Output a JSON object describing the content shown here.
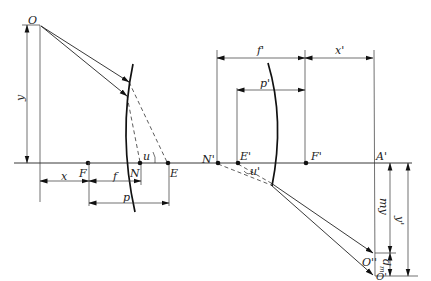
{
  "diagram": {
    "title": "",
    "points": {
      "O": "O",
      "F": "F",
      "N": "N",
      "E": "E",
      "N_prime": "N'",
      "E_prime": "E'",
      "F_prime": "F'",
      "A_prime": "A'",
      "O_double_prime": "O''",
      "O_prime": "O'"
    },
    "dimensions": {
      "y": "y",
      "x": "x",
      "f": "f",
      "p": "p",
      "u": "u",
      "f_prime": "f'",
      "x_prime": "x'",
      "p_prime": "p'",
      "u_prime": "u'",
      "my": "my",
      "y_prime": "y'",
      "d_m": "d",
      "d_m_sub": "m"
    }
  }
}
